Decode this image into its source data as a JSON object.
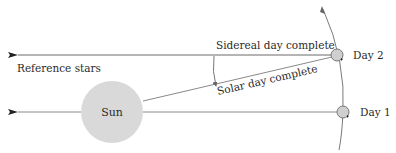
{
  "diagram": {
    "labels": {
      "reference_stars": "Reference stars",
      "sidereal": "Sidereal day complete",
      "solar": "Solar day complete",
      "sun": "Sun",
      "day1": "Day 1",
      "day2": "Day 2"
    },
    "colors": {
      "line": "#6a6a6a",
      "sun_fill": "#d9d9d9",
      "planet_fill": "#d0d0d0",
      "text": "#2a2a2a"
    }
  }
}
